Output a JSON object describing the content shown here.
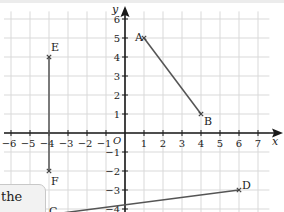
{
  "diagram": {
    "axes": {
      "x_label": "x",
      "y_label": "y",
      "origin_label": "O",
      "x_ticks": [
        -6,
        -5,
        -4,
        -3,
        -2,
        -1,
        1,
        2,
        3,
        4,
        5,
        6,
        7
      ],
      "y_ticks": [
        -4,
        -3,
        -2,
        -1,
        1,
        2,
        3,
        4,
        5,
        6
      ]
    },
    "points": {
      "A": {
        "label": "A",
        "x": 1,
        "y": 5
      },
      "B": {
        "label": "B",
        "x": 4,
        "y": 1
      },
      "C": {
        "label": "C",
        "x": -4,
        "y": -4.3
      },
      "D": {
        "label": "D",
        "x": 6,
        "y": -3
      },
      "E": {
        "label": "E",
        "x": -4,
        "y": 4
      },
      "F": {
        "label": "F",
        "x": -4,
        "y": -2
      }
    },
    "segments": [
      {
        "from": "A",
        "to": "B"
      },
      {
        "from": "E",
        "to": "F"
      },
      {
        "from": "C",
        "to": "D"
      }
    ],
    "colors": {
      "grid": "#d9d9d9",
      "axis": "#1a1a1a",
      "segment": "#555555",
      "marker": "#444444"
    }
  },
  "callout": {
    "text": "the"
  }
}
